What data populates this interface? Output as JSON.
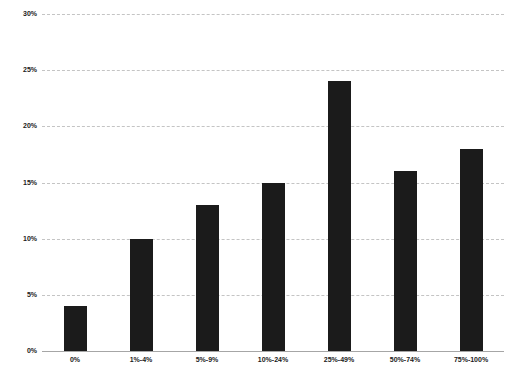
{
  "chart_data": {
    "type": "bar",
    "title": "",
    "categories": [
      "0%",
      "1%-4%",
      "5%-9%",
      "10%-24%",
      "25%-49%",
      "50%-74%",
      "75%-100%"
    ],
    "values": [
      4,
      10,
      13,
      15,
      24,
      16,
      18
    ],
    "xlabel": "",
    "ylabel": "",
    "ylim": [
      0,
      30
    ],
    "ytick_step": 5,
    "ytick_labels": [
      "0%",
      "5%",
      "10%",
      "15%",
      "20%",
      "25%",
      "30%"
    ],
    "grid": true,
    "legend": false,
    "bar_color": "#1b1b1b",
    "gridline_color": "#c4c4c4",
    "axis_line_color": "#a6a6a6",
    "label_color": "#1a1a1a",
    "background_color": "#ffffff"
  }
}
